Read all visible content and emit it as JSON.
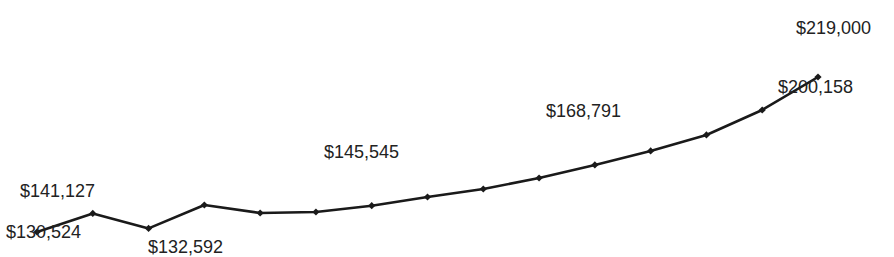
{
  "chart_data": {
    "type": "line",
    "title": "",
    "xlabel": "",
    "ylabel": "",
    "grid": false,
    "legend": null,
    "x": [
      1,
      2,
      3,
      4,
      5,
      6,
      7,
      8,
      9,
      10,
      11,
      12,
      13,
      14,
      15
    ],
    "values": [
      130524,
      141127,
      132592,
      145941,
      141373,
      141944,
      145545,
      150509,
      155077,
      161358,
      168791,
      176775,
      185911,
      200158,
      219000
    ],
    "labeled_points": [
      {
        "index": 0,
        "label": "$130,524",
        "position": "below"
      },
      {
        "index": 1,
        "label": "$141,127",
        "position": "above"
      },
      {
        "index": 2,
        "label": "$132,592",
        "position": "below"
      },
      {
        "index": 6,
        "label": "$145,545",
        "position": "above"
      },
      {
        "index": 10,
        "label": "$168,791",
        "position": "above"
      },
      {
        "index": 13,
        "label": "$200,158",
        "position": "right"
      },
      {
        "index": 14,
        "label": "$219,000",
        "position": "above"
      }
    ],
    "ylim": [
      130524,
      219000
    ],
    "line_color": "#1a1a1a",
    "marker": "diamond"
  },
  "labels": {
    "l0": "$130,524",
    "l1": "$141,127",
    "l2": "$132,592",
    "l6": "$145,545",
    "l10": "$168,791",
    "l13": "$200,158",
    "l14": "$219,000"
  }
}
